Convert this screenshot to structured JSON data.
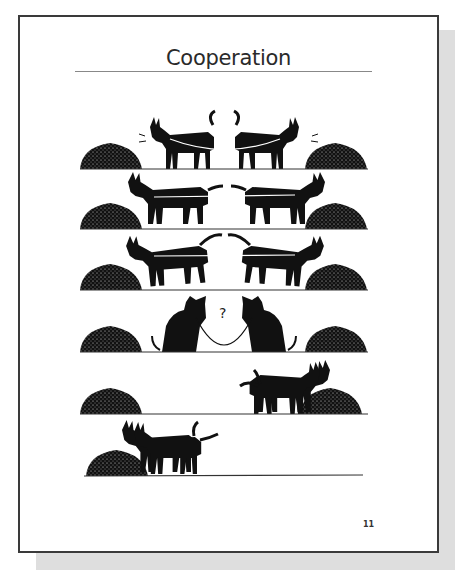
{
  "page": {
    "title": "Cooperation",
    "page_number": "11",
    "question_mark": "?"
  },
  "panels": [
    {
      "index": 1,
      "scene": "two mules tied together pulling in opposite directions toward separate hay piles"
    },
    {
      "index": 2,
      "scene": "two mules straining apart, rope taut"
    },
    {
      "index": 3,
      "scene": "two mules bucking and pulling harder"
    },
    {
      "index": 4,
      "scene": "two mules sitting, facing each other, puzzled"
    },
    {
      "index": 5,
      "scene": "both mules eat together from the right hay pile"
    },
    {
      "index": 6,
      "scene": "both mules eat together from the left hay pile"
    }
  ],
  "colors": {
    "ink": "#111111",
    "frame": "#3a3a3a",
    "shadow": "#dedede",
    "paper": "#ffffff"
  }
}
